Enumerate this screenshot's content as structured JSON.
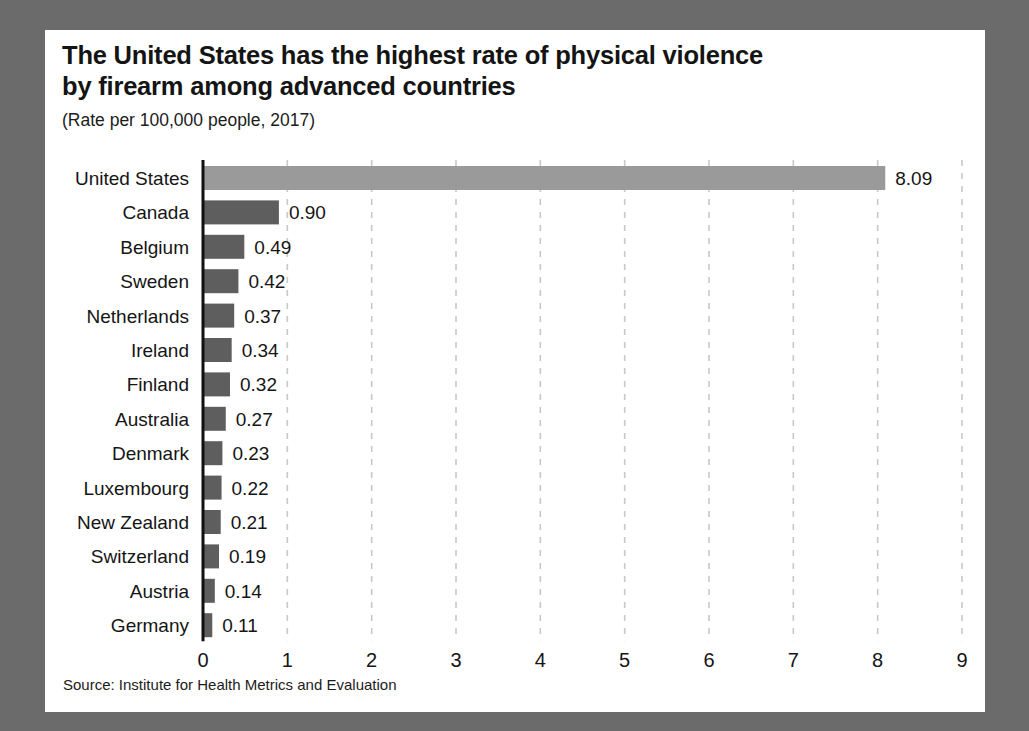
{
  "figure": {
    "title": "The United States has the highest rate of physical violence\nby firearm among advanced countries",
    "subtitle": "(Rate per 100,000 people, 2017)",
    "source": "Source: Institute for Health Metrics and Evaluation",
    "background_color": "#6b6b6b",
    "card_color": "#ffffff",
    "highlight_bar_color": "#9a9a9a",
    "bar_color": "#5e5e5e",
    "axis_color": "#111111",
    "gridline_color": "#c8c8c8"
  },
  "chart_data": {
    "type": "bar",
    "orientation": "horizontal",
    "title": "The United States has the highest rate of physical violence by firearm among advanced countries",
    "subtitle": "(Rate per 100,000 people, 2017)",
    "xlabel": "",
    "ylabel": "",
    "xlim": [
      0,
      9
    ],
    "xticks": [
      "0",
      "1",
      "2",
      "3",
      "4",
      "5",
      "6",
      "7",
      "8",
      "9"
    ],
    "grid": "vertical-dashed",
    "legend": "none",
    "value_labels": true,
    "categories": [
      "United States",
      "Canada",
      "Belgium",
      "Sweden",
      "Netherlands",
      "Ireland",
      "Finland",
      "Australia",
      "Denmark",
      "Luxembourg",
      "New Zealand",
      "Switzerland",
      "Austria",
      "Germany"
    ],
    "values": [
      8.09,
      0.9,
      0.49,
      0.42,
      0.37,
      0.34,
      0.32,
      0.27,
      0.23,
      0.22,
      0.21,
      0.19,
      0.14,
      0.11
    ],
    "value_labels_text": [
      "8.09",
      "0.90",
      "0.49",
      "0.42",
      "0.37",
      "0.34",
      "0.32",
      "0.27",
      "0.23",
      "0.22",
      "0.21",
      "0.19",
      "0.14",
      "0.11"
    ],
    "highlight_index": 0
  }
}
